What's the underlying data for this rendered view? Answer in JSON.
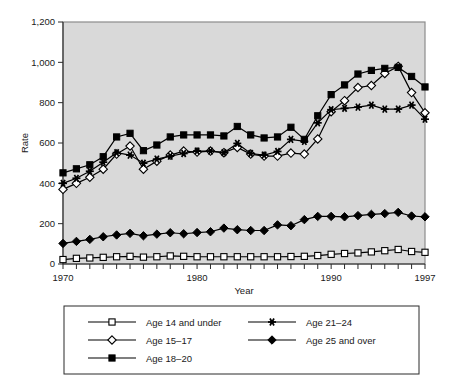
{
  "chart_data": {
    "type": "line",
    "title": "",
    "xlabel": "Year",
    "ylabel": "Rate",
    "xlim": [
      1970,
      1997
    ],
    "ylim": [
      0,
      1200
    ],
    "grid": false,
    "background": "#d9d9d9",
    "legend_position": "bottom",
    "x_tick_labels": [
      "1970",
      "1980",
      "1990",
      "1997"
    ],
    "x_tick_values": [
      1970,
      1980,
      1990,
      1997
    ],
    "x_minor_ticks_every": 1,
    "y_tick_labels": [
      "0",
      "200",
      "400",
      "600",
      "800",
      "1,000",
      "1,200"
    ],
    "y_tick_values": [
      0,
      200,
      400,
      600,
      800,
      1000,
      1200
    ],
    "x": [
      1970,
      1971,
      1972,
      1973,
      1974,
      1975,
      1976,
      1977,
      1978,
      1979,
      1980,
      1981,
      1982,
      1983,
      1984,
      1985,
      1986,
      1987,
      1988,
      1989,
      1990,
      1991,
      1992,
      1993,
      1994,
      1995,
      1996,
      1997
    ],
    "series": [
      {
        "name": "Age 14 and under",
        "marker": "open-square",
        "color": "#000000",
        "values": [
          22,
          28,
          30,
          33,
          36,
          38,
          34,
          36,
          40,
          38,
          36,
          36,
          36,
          36,
          36,
          36,
          36,
          37,
          38,
          42,
          48,
          52,
          55,
          60,
          66,
          72,
          62,
          58
        ]
      },
      {
        "name": "Age 15–17",
        "marker": "open-diamond",
        "color": "#000000",
        "values": [
          370,
          400,
          430,
          470,
          545,
          585,
          470,
          510,
          540,
          560,
          555,
          560,
          552,
          578,
          545,
          535,
          535,
          550,
          545,
          620,
          755,
          810,
          875,
          885,
          945,
          980,
          850,
          750
        ]
      },
      {
        "name": "Age 18–20",
        "marker": "solid-square",
        "color": "#000000",
        "values": [
          452,
          472,
          492,
          532,
          630,
          648,
          562,
          590,
          630,
          640,
          640,
          640,
          635,
          682,
          640,
          625,
          630,
          678,
          618,
          735,
          840,
          888,
          942,
          960,
          970,
          975,
          930,
          878
        ]
      },
      {
        "name": "Age 21–24",
        "marker": "star",
        "color": "#000000",
        "values": [
          400,
          425,
          460,
          505,
          552,
          540,
          500,
          520,
          535,
          548,
          560,
          560,
          552,
          598,
          548,
          540,
          558,
          618,
          608,
          700,
          765,
          772,
          778,
          788,
          768,
          768,
          788,
          718
        ]
      },
      {
        "name": "Age 25 and over",
        "marker": "solid-diamond",
        "color": "#000000",
        "values": [
          102,
          112,
          122,
          135,
          144,
          152,
          140,
          148,
          155,
          150,
          156,
          160,
          178,
          170,
          166,
          166,
          194,
          190,
          220,
          236,
          236,
          234,
          240,
          246,
          250,
          256,
          238,
          234
        ]
      }
    ]
  },
  "legend": {
    "items": [
      {
        "label": "Age 14 and under",
        "marker": "open-square"
      },
      {
        "label": "Age 15–17",
        "marker": "open-diamond"
      },
      {
        "label": "Age 18–20",
        "marker": "solid-square"
      },
      {
        "label": "Age 21–24",
        "marker": "star"
      },
      {
        "label": "Age 25 and over",
        "marker": "solid-diamond"
      }
    ]
  }
}
